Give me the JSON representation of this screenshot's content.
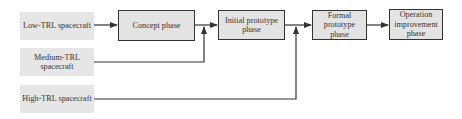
{
  "diagram": {
    "sources": [
      {
        "id": "low",
        "label": "Low-TRL spacecraft"
      },
      {
        "id": "medium",
        "label": "Medium-TRL spacecraft"
      },
      {
        "id": "high",
        "label": "High-TRL spacecraft"
      }
    ],
    "phases": [
      {
        "id": "concept",
        "label": "Concept phase"
      },
      {
        "id": "initial",
        "label": "Initial prototype phase"
      },
      {
        "id": "formal",
        "label": "Formal prototype phase"
      },
      {
        "id": "operation",
        "label": "Operation improvement phase"
      }
    ],
    "edges": [
      {
        "from": "low",
        "to": "concept"
      },
      {
        "from": "concept",
        "to": "initial"
      },
      {
        "from": "medium",
        "to": "initial"
      },
      {
        "from": "initial",
        "to": "formal"
      },
      {
        "from": "high",
        "to": "formal"
      },
      {
        "from": "formal",
        "to": "operation"
      }
    ],
    "colors": {
      "box_fill": "#e3e3e3",
      "line": "#333333"
    }
  }
}
